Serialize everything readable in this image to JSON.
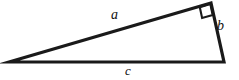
{
  "figure": {
    "name": "right-triangle-diagram",
    "type": "geometry-diagram",
    "background_color": "#ffffff",
    "stroke_color": "#1a1a1a",
    "canvas": {
      "width": 239,
      "height": 80
    }
  },
  "triangle": {
    "vertices": {
      "left": {
        "x": 9,
        "y": 62
      },
      "apex": {
        "x": 211,
        "y": 3
      },
      "bottom_right": {
        "x": 224,
        "y": 62
      }
    },
    "right_angle_vertex": "apex",
    "right_angle_marker": {
      "present": true,
      "size": 11
    },
    "stroke_width": 3.2
  },
  "labels": {
    "side_a": "a",
    "side_b": "b",
    "side_c": "c"
  },
  "sides": [
    {
      "name": "a",
      "label": "a",
      "from": "left",
      "to": "apex",
      "role": "leg"
    },
    {
      "name": "b",
      "label": "b",
      "from": "apex",
      "to": "bottom_right",
      "role": "leg"
    },
    {
      "name": "c",
      "label": "c",
      "from": "left",
      "to": "bottom_right",
      "role": "hypotenuse"
    }
  ]
}
